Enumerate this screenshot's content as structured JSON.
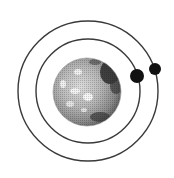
{
  "illustration": {
    "subject": "planet with two orbiting moons",
    "colors": {
      "background": "#ffffff",
      "orbit": "#3a3a3a",
      "moon": "#111111",
      "planet_light": "#e8e8e8",
      "planet_mid": "#9a9a9a",
      "planet_dark": "#2a2a2a"
    },
    "orbits": [
      {
        "name": "inner-orbit",
        "cx": 88,
        "cy": 91,
        "r": 52
      },
      {
        "name": "outer-orbit",
        "cx": 88,
        "cy": 91,
        "r": 70
      }
    ],
    "planet": {
      "cx": 87,
      "cy": 92,
      "r": 34
    },
    "moons": [
      {
        "name": "inner-moon",
        "cx": 137,
        "cy": 76,
        "r": 7
      },
      {
        "name": "outer-moon",
        "cx": 155,
        "cy": 69,
        "r": 6
      }
    ]
  }
}
